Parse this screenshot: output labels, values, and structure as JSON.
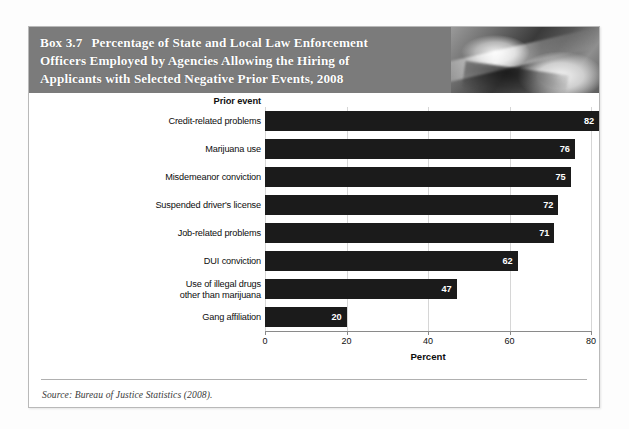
{
  "box": {
    "label": "Box 3.7",
    "title": "Percentage of State and Local Law Enforcement Officers Employed by Agencies Allowing the Hiring of Applicants with Selected Negative Prior Events, 2008",
    "title_line1": "Percentage of State and Local Law Enforcement",
    "title_line2": "Officers Employed by Agencies Allowing the Hiring of",
    "title_line3": "Applicants with Selected Negative Prior Events, 2008",
    "header_photo_alt": "law-enforcement-photo",
    "source": "Source: Bureau of Justice Statistics (2008)."
  },
  "chart_data": {
    "type": "bar",
    "orientation": "horizontal",
    "title": "Percentage of State and Local Law Enforcement Officers Employed by Agencies Allowing the Hiring of Applicants with Selected Negative Prior Events, 2008",
    "category_header": "Prior event",
    "categories": [
      "Credit-related problems",
      "Marijuana use",
      "Misdemeanor conviction",
      "Suspended driver's license",
      "Job-related problems",
      "DUI conviction",
      "Use of illegal drugs other than marijuana",
      "Gang affiliation"
    ],
    "values": [
      82,
      76,
      75,
      72,
      71,
      62,
      47,
      20
    ],
    "xlabel": "Percent",
    "ylabel": "",
    "xlim": [
      0,
      80
    ],
    "xticks": [
      0,
      20,
      40,
      60,
      80
    ],
    "grid": true,
    "legend": false,
    "bar_color": "#1b1b1b",
    "value_label_color": "#ffffff"
  },
  "rows": [
    {
      "label_line1": "Credit-related problems",
      "label_line2": "",
      "value": 82
    },
    {
      "label_line1": "Marijuana use",
      "label_line2": "",
      "value": 76
    },
    {
      "label_line1": "Misdemeanor conviction",
      "label_line2": "",
      "value": 75
    },
    {
      "label_line1": "Suspended driver's license",
      "label_line2": "",
      "value": 72
    },
    {
      "label_line1": "Job-related problems",
      "label_line2": "",
      "value": 71
    },
    {
      "label_line1": "DUI conviction",
      "label_line2": "",
      "value": 62
    },
    {
      "label_line1": "Use of illegal drugs",
      "label_line2": "other than marijuana",
      "value": 47
    },
    {
      "label_line1": "Gang affiliation",
      "label_line2": "",
      "value": 20
    }
  ],
  "colors": {
    "header_band": "#7b7b7b",
    "bar": "#1b1b1b",
    "box_border": "#b9b9b9",
    "gridline": "#d6d6d6",
    "axis": "#8a8a8a"
  }
}
